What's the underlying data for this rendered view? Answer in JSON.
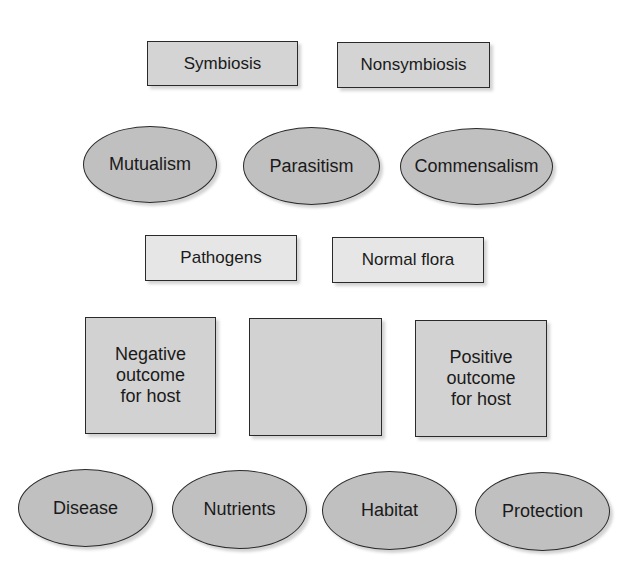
{
  "colors": {
    "rect_fill": "#d4d4d4",
    "rect_light_fill": "#e6e6e6",
    "ellipse_fill": "#c0c0c0",
    "border": "#2a2a2a"
  },
  "row1": {
    "boxes": [
      {
        "label": "Symbiosis"
      },
      {
        "label": "Nonsymbiosis"
      }
    ]
  },
  "row2": {
    "ellipses": [
      {
        "label": "Mutualism"
      },
      {
        "label": "Parasitism"
      },
      {
        "label": "Commensalism"
      }
    ]
  },
  "row3": {
    "boxes": [
      {
        "label": "Pathogens"
      },
      {
        "label": "Normal flora"
      }
    ]
  },
  "row4": {
    "squares": [
      {
        "line1": "Negative",
        "line2": "outcome",
        "line3": "for host"
      },
      {
        "line1": "",
        "line2": "",
        "line3": ""
      },
      {
        "line1": "Positive",
        "line2": "outcome",
        "line3": "for host"
      }
    ]
  },
  "row5": {
    "ellipses": [
      {
        "label": "Disease"
      },
      {
        "label": "Nutrients"
      },
      {
        "label": "Habitat"
      },
      {
        "label": "Protection"
      }
    ]
  }
}
